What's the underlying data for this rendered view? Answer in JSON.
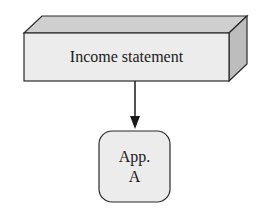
{
  "diagram": {
    "source_node": {
      "label": "Income statement",
      "shape": "3d-box",
      "colors": {
        "front": "#ececec",
        "top": "#cfcfcf",
        "side": "#bdbdbd",
        "stroke": "#2a2a2a"
      }
    },
    "target_node": {
      "line1": "App.",
      "line2": "A",
      "shape": "rounded-rectangle",
      "colors": {
        "fill": "#ececec",
        "stroke": "#2a2a2a"
      }
    },
    "edge": {
      "from": "Income statement",
      "to": "App. A",
      "style": "arrow-down"
    }
  }
}
